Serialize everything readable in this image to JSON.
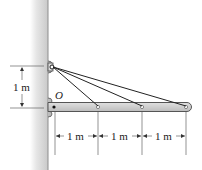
{
  "diagram": {
    "type": "statics-beam-cables",
    "point_label": "O",
    "vertical_dimension": "1 m",
    "horizontal_dimensions": [
      "1 m",
      "1 m",
      "1 m"
    ],
    "colors": {
      "wall": "#d4d4d4",
      "wall_edge": "#9a9a9a",
      "beam": "#c8c8c8",
      "beam_edge": "#555555",
      "cable": "#222222",
      "dimension": "#333333"
    }
  }
}
